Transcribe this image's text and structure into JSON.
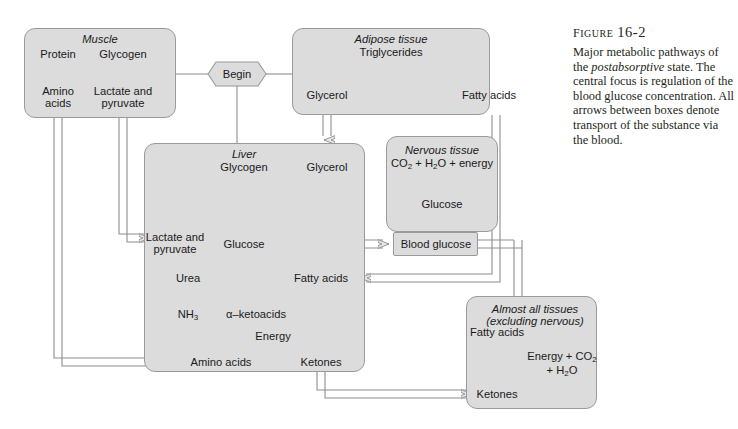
{
  "figure": {
    "number": "Figure 16-2",
    "caption_line1": "Major metabolic pathways",
    "caption_line2_pre": "of the ",
    "caption_line2_em": "postabsorptive",
    "caption_line2_post": " state.",
    "caption_line3": "The central focus is",
    "caption_line4": "regulation of the blood",
    "caption_line5": "glucose concentration. All",
    "caption_line6": "arrows between boxes denote",
    "caption_line7": "transport of the substance",
    "caption_line8": "via the blood."
  },
  "colors": {
    "box_fill": "#dcdcdc",
    "box_stroke": "#9a9a9a",
    "arrow_stroke": "#8d8d8d",
    "arrow_fill": "#e8e8e8",
    "text": "#1a1a1a",
    "page_bg": "#ffffff"
  },
  "start_node": {
    "label": "Begin",
    "shape": "hexagon"
  },
  "boxes": [
    {
      "id": "muscle",
      "title": "Muscle",
      "title_italic": true,
      "nodes": [
        "Protein",
        "Glycogen",
        "Amino acids",
        "Lactate and pyruvate"
      ]
    },
    {
      "id": "adipose",
      "title": "Adipose tissue",
      "title_italic": true,
      "nodes": [
        "Triglycerides",
        "Glycerol",
        "Fatty acids"
      ]
    },
    {
      "id": "liver",
      "title": "Liver",
      "title_italic": true,
      "nodes": [
        "Glycogen",
        "Glycerol",
        "Lactate and pyruvate",
        "Glucose",
        "Urea",
        "NH3",
        "α-ketoacids",
        "Fatty acids",
        "Energy",
        "Amino acids",
        "Ketones"
      ]
    },
    {
      "id": "nervous",
      "title": "Nervous tissue",
      "title_italic": true,
      "nodes": [
        "CO2 + H2O + energy",
        "Glucose"
      ]
    },
    {
      "id": "blood-glucose",
      "title": "Blood glucose",
      "title_italic": false,
      "nodes": []
    },
    {
      "id": "all-tissues",
      "title": "Almost all tissues",
      "title_line2": "(excluding nervous)",
      "title_italic": true,
      "nodes": [
        "Fatty acids",
        "Energy + CO2 + H2O",
        "Ketones"
      ]
    }
  ],
  "labels": {
    "muscle_title": "Muscle",
    "muscle_protein": "Protein",
    "muscle_glycogen": "Glycogen",
    "muscle_amino_1": "Amino",
    "muscle_amino_2": "acids",
    "muscle_lactate_1": "Lactate and",
    "muscle_lactate_2": "pyruvate",
    "begin": "Begin",
    "adipose_title": "Adipose tissue",
    "adipose_trig": "Triglycerides",
    "adipose_glycerol": "Glycerol",
    "adipose_fatty": "Fatty acids",
    "liver_title": "Liver",
    "liver_glycogen": "Glycogen",
    "liver_glycerol": "Glycerol",
    "liver_lactate_1": "Lactate and",
    "liver_lactate_2": "pyruvate",
    "liver_glucose": "Glucose",
    "liver_urea": "Urea",
    "liver_nh3": "NH",
    "liver_nh3_sub": "3",
    "liver_ketoacids": "α–ketoacids",
    "liver_fatty": "Fatty acids",
    "liver_energy": "Energy",
    "liver_amino": "Amino acids",
    "liver_ketones": "Ketones",
    "nervous_title": "Nervous tissue",
    "nervous_co2": "CO",
    "nervous_co2_sub": "2",
    "nervous_plus_h": " + H",
    "nervous_h2o_sub": "2",
    "nervous_o_energy": "O + energy",
    "nervous_glucose": "Glucose",
    "blood_glucose": "Blood glucose",
    "tissues_title_1": "Almost all tissues",
    "tissues_title_2": "(excluding nervous)",
    "tissues_fatty": "Fatty acids",
    "tissues_energy_1": "Energy + CO",
    "tissues_energy_1_sub": "2",
    "tissues_energy_2": "+ H",
    "tissues_energy_2_sub": "2",
    "tissues_energy_3": "O",
    "tissues_ketones": "Ketones"
  }
}
